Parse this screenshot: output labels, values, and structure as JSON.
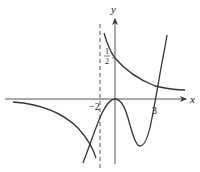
{
  "diagram": {
    "type": "function-graph",
    "axes": {
      "x_label": "x",
      "y_label": "y",
      "origin_label": ""
    },
    "tick_labels": {
      "x_neg": "−2",
      "x_pos": "3",
      "y_half_num": "1",
      "y_half_den": "2"
    },
    "asymptote": {
      "x": -2,
      "style": "dashed"
    },
    "curves": [
      {
        "name": "hyperbola-upper-right",
        "description": "decreasing branch right of x=-2, passes (0, 1/2), approaches y=0 from above"
      },
      {
        "name": "hyperbola-lower-left",
        "description": "branch left of x=-2, below x-axis, approaches y=0 from below as x→-∞, decreasing toward -∞ near x=-2"
      },
      {
        "name": "cubic-curve",
        "description": "rises from lower-left, local max at origin (0,0), local min between 0 and 3, crosses x-axis at x=3 and rises"
      }
    ],
    "colors": {
      "stroke": "#333333",
      "axis": "#555555",
      "background": "#ffffff"
    }
  }
}
